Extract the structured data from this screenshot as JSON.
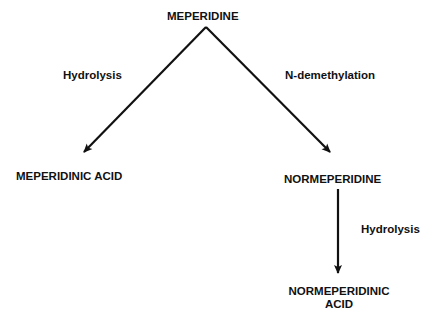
{
  "diagram": {
    "root": "MEPERIDINE",
    "left_pathway": {
      "reaction": "Hydrolysis",
      "product": "MEPERIDINIC ACID"
    },
    "right_pathway": {
      "reaction": "N-demethylation",
      "product": "NORMEPERIDINE"
    },
    "secondary_pathway": {
      "reaction": "Hydrolysis",
      "product_line1": "NORMEPERIDINIC",
      "product_line2": "ACID"
    },
    "colors": {
      "ink": "#111111",
      "background": "#ffffff"
    }
  }
}
